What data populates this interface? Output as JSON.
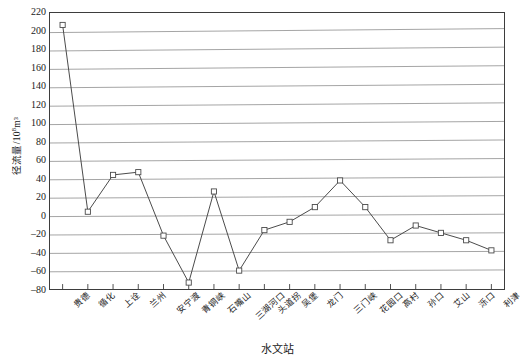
{
  "chart_data": {
    "type": "line",
    "title": "",
    "xlabel": "水文站",
    "ylabel": "径流量/10⁸m³",
    "ylabel_main": "径流量/10",
    "ylabel_exp": "8",
    "ylabel_tail": "m³",
    "ylim": [
      -80,
      220
    ],
    "ytick_step": 20,
    "yticks": [
      220,
      200,
      180,
      160,
      140,
      120,
      100,
      80,
      60,
      40,
      20,
      0,
      -20,
      -40,
      -60,
      -80
    ],
    "grid": true,
    "legend": "none",
    "marker": "open-square",
    "line_color": "#4a4a4a",
    "grid_color": "#9a9a9a",
    "axis_color": "#3d3d3d",
    "categories": [
      "贵德",
      "循化",
      "上诠",
      "兰州",
      "安宁渡",
      "青铜峡",
      "石嘴山",
      "三湖河口",
      "头道拐",
      "吴堡",
      "龙门",
      "三门峡",
      "花园口",
      "高村",
      "孙口",
      "艾山",
      "泺口",
      "利津"
    ],
    "values": [
      207,
      4,
      44,
      47,
      -22,
      -73,
      26,
      -60,
      -16,
      -7,
      9,
      38,
      9,
      -27,
      -11,
      -19,
      -27,
      -38
    ],
    "series": [
      {
        "name": "径流量",
        "values": [
          207,
          4,
          44,
          47,
          -22,
          -73,
          26,
          -60,
          -16,
          -7,
          9,
          38,
          9,
          -27,
          -11,
          -19,
          -27,
          -38
        ]
      }
    ]
  }
}
